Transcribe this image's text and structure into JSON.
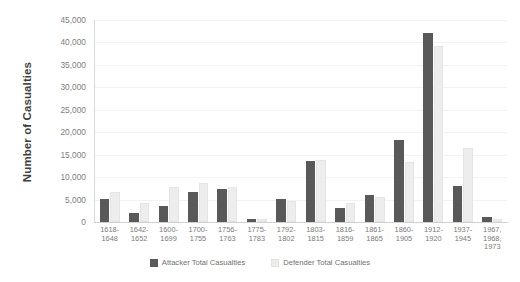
{
  "chart_data": {
    "type": "bar",
    "title": "",
    "xlabel": "",
    "ylabel": "Number of Casualties",
    "ylim": [
      0,
      45000
    ],
    "ytick_step": 5000,
    "yticks": [
      "45,000",
      "40,000",
      "35,000",
      "30,000",
      "25,000",
      "20,000",
      "15,000",
      "10,000",
      "5,000",
      "0"
    ],
    "grid": true,
    "legend_position": "bottom",
    "categories": [
      "1618-\n1648",
      "1642-\n1652",
      "1600-\n1699",
      "1700-\n1755",
      "1756-\n1763",
      "1775-\n1783",
      "1792-\n1802",
      "1803-\n1815",
      "1816-\n1859",
      "1861-\n1865",
      "1860-\n1905",
      "1912-\n1920",
      "1937-\n1945",
      "1967,\n1968,\n1973"
    ],
    "series": [
      {
        "name": "Attacker Total Casualties",
        "color": "#595959",
        "values": [
          5200,
          2100,
          3500,
          6600,
          7300,
          700,
          5100,
          13600,
          3100,
          6000,
          18200,
          42000,
          8000,
          1100
        ]
      },
      {
        "name": "Defender Total Casualties",
        "color": "#ededed",
        "values": [
          6700,
          4200,
          7800,
          8600,
          7800,
          600,
          4600,
          13800,
          4200,
          5500,
          13300,
          39200,
          16600,
          600
        ]
      }
    ]
  },
  "legend": {
    "items": [
      {
        "label": "Attacker Total Casualties",
        "swatch": "attacker-swatch"
      },
      {
        "label": "Defender Total Casualties",
        "swatch": "defender-swatch"
      }
    ]
  }
}
